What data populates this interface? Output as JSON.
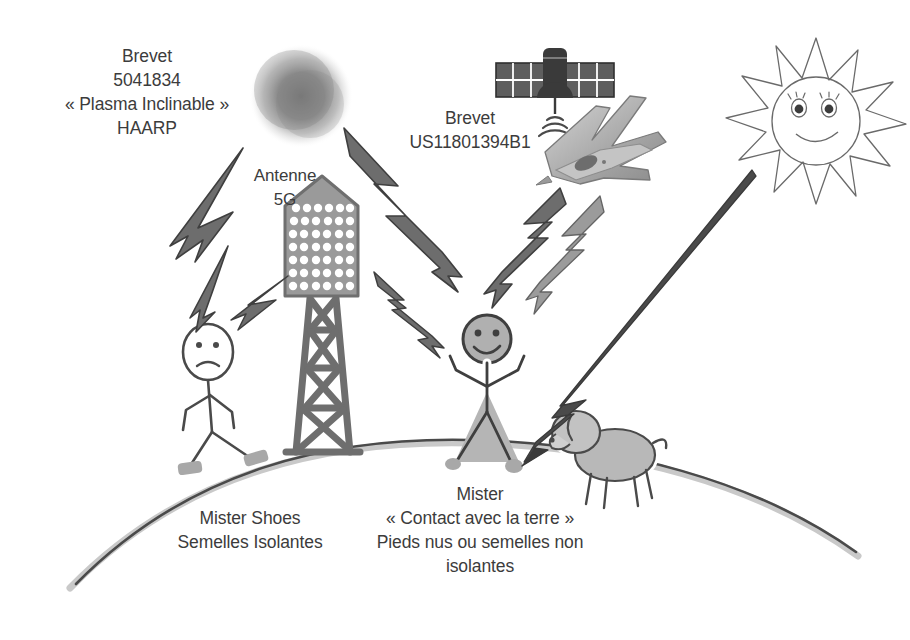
{
  "figure": {
    "background_color": "#ffffff",
    "ink_color": "#3c3c3c",
    "gray_fill": "#b3b3b3",
    "gray_dark": "#6f6f6f"
  },
  "labels": {
    "haarp": "Brevet\n5041834\n« Plasma Inclinable »\nHAARP",
    "antenne": "Antenne\n5G",
    "brevet_us": "Brevet\nUS11801394B1",
    "mister_shoes": "Mister Shoes\nSemelles Isolantes",
    "mister_contact": "Mister\n« Contact avec la terre »\nPieds nus ou semelles non\nisolantes"
  },
  "objects": {
    "plasma_cloud": "plasma-cloud",
    "satellite": "satellite",
    "jet": "fighter-jet",
    "sun": "smiling-sun",
    "antenna_tower": "5g-antenna-tower",
    "figure_left": "sad-stick-figure-with-shoes",
    "figure_right": "happy-stick-figure-barefoot",
    "dog": "dog",
    "ground": "curved-earth-ground"
  },
  "counts": {
    "antenna_dot_columns": 6,
    "antenna_dot_rows": 7,
    "sun_rays": 12,
    "satellite_panel_cells": 6,
    "signal_arcs": 3
  }
}
